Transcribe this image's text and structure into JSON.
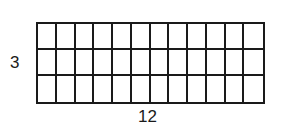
{
  "diagram": {
    "type": "array-grid",
    "rows": 3,
    "columns": 12,
    "row_label": "3",
    "column_label": "12",
    "line_color": "#1a1a1a",
    "background": "#ffffff"
  }
}
